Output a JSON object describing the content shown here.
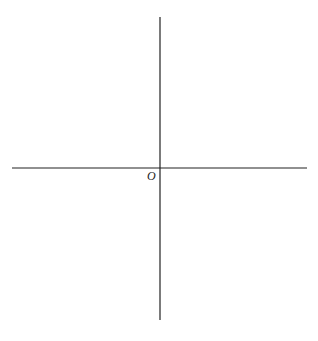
{
  "diagram": {
    "type": "cartesian-axes",
    "origin_label": "O",
    "axes": {
      "x_axis": {
        "x1": 12,
        "y1": 168,
        "x2": 307,
        "y2": 168
      },
      "y_axis": {
        "x1": 160,
        "y1": 17,
        "x2": 160,
        "y2": 320
      }
    },
    "colors": {
      "axis": "#222222",
      "background": "#ffffff"
    }
  }
}
